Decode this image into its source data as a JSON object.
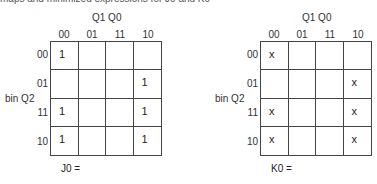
{
  "header_fragment": "maps and minimized expressions for J0 and K0",
  "kmaps": [
    {
      "name": "J0",
      "column_variable": "Q1 Q0",
      "row_variable": "bin Q2",
      "column_labels": [
        "00",
        "01",
        "11",
        "10"
      ],
      "row_labels": [
        "00",
        "01",
        "11",
        "10"
      ],
      "cells": [
        [
          "1",
          "",
          "",
          ""
        ],
        [
          "",
          "",
          "",
          "1"
        ],
        [
          "1",
          "",
          "",
          "1"
        ],
        [
          "1",
          "",
          "",
          "1"
        ]
      ],
      "expression_label": "J0 ="
    },
    {
      "name": "K0",
      "column_variable": "Q1 Q0",
      "row_variable": "bin Q2",
      "column_labels": [
        "00",
        "01",
        "11",
        "10"
      ],
      "row_labels": [
        "00",
        "01",
        "11",
        "10"
      ],
      "cells": [
        [
          "x",
          "",
          "",
          ""
        ],
        [
          "",
          "",
          "",
          "x"
        ],
        [
          "x",
          "",
          "",
          "x"
        ],
        [
          "x",
          "",
          "",
          "x"
        ]
      ],
      "expression_label": "K0 ="
    }
  ]
}
